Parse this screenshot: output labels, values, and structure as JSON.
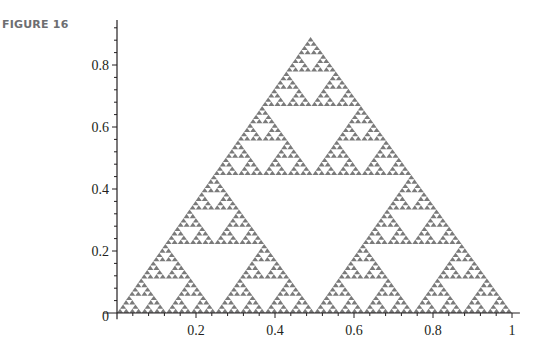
{
  "figure": {
    "label": "FIGURE 16"
  },
  "chart_data": {
    "type": "scatter",
    "title": "",
    "subtitle": "Sierpinski triangle (fractal point plot)",
    "xlabel": "",
    "ylabel": "",
    "xlim": [
      0,
      1.02
    ],
    "ylim": [
      0,
      0.945
    ],
    "x_ticks": [
      {
        "value": 0.2,
        "label": "0.2"
      },
      {
        "value": 0.4,
        "label": "0.4"
      },
      {
        "value": 0.6,
        "label": "0.6"
      },
      {
        "value": 0.8,
        "label": "0.8"
      },
      {
        "value": 1,
        "label": "1"
      }
    ],
    "y_ticks": [
      {
        "value": 0.2,
        "label": "0.2"
      },
      {
        "value": 0.4,
        "label": "0.4"
      },
      {
        "value": 0.6,
        "label": "0.6"
      },
      {
        "value": 0.8,
        "label": "0.8"
      }
    ],
    "origin_label": "0",
    "minor_ticks_per_major": 4,
    "grid": false,
    "legend": null,
    "shape": {
      "name": "Sierpinski triangle",
      "vertices": [
        [
          0,
          0
        ],
        [
          1,
          0
        ],
        [
          0.49,
          0.89
        ]
      ],
      "depth": 6,
      "fill_color": "#7a7a7a"
    }
  },
  "colors": {
    "axis": "#231f20",
    "label": "#6d6e71",
    "points": "#7a7a7a"
  }
}
